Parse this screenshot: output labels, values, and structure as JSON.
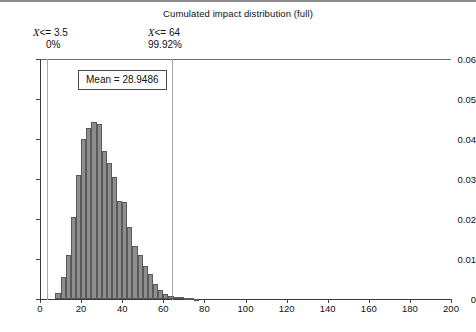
{
  "chart_data": {
    "type": "bar",
    "title": "Cumulated impact distribution (full)",
    "xlabel": "",
    "ylabel": "",
    "xlim": [
      0,
      200
    ],
    "ylim": [
      0,
      0.06
    ],
    "grid": false,
    "legend": null,
    "bin_width": 2.5,
    "x_ticks": [
      0,
      20,
      40,
      60,
      80,
      100,
      120,
      140,
      160,
      180,
      200
    ],
    "x_tick_labels": [
      "0",
      "20",
      "40",
      "60",
      "80",
      "100",
      "120",
      "140",
      "160",
      "180",
      "200"
    ],
    "y_ticks": [
      0,
      0.01,
      0.02,
      0.03,
      0.04,
      0.05,
      0.06
    ],
    "y_tick_labels": [
      "0",
      "0.01",
      "0.02",
      "0.03",
      "0.04",
      "0.05",
      "0.06"
    ],
    "bin_starts": [
      7.5,
      10.0,
      12.5,
      15.0,
      17.5,
      20.0,
      22.5,
      25.0,
      27.5,
      30.0,
      32.5,
      35.0,
      37.5,
      40.0,
      42.5,
      45.0,
      47.5,
      50.0,
      52.5,
      55.0,
      57.5,
      60.0,
      62.5,
      65.0,
      67.5,
      70.0,
      72.5,
      75.0
    ],
    "values": [
      0.0015,
      0.0055,
      0.011,
      0.0205,
      0.031,
      0.04,
      0.0428,
      0.0443,
      0.0438,
      0.037,
      0.034,
      0.0305,
      0.0245,
      0.0243,
      0.018,
      0.0133,
      0.011,
      0.0083,
      0.0063,
      0.0038,
      0.0023,
      0.0013,
      0.0008,
      0.0005,
      0.0004,
      0.0003,
      0.0002,
      0.0001
    ],
    "markers": [
      {
        "id": "lower",
        "x": 3.5,
        "label_line1": "X <= 3.5",
        "label_line2": "0%"
      },
      {
        "id": "upper",
        "x": 64,
        "label_line1": "X <= 64",
        "label_line2": "99.92%"
      }
    ],
    "mean": 28.9486,
    "mean_label": "Mean = 28.9486",
    "colors": {
      "bar_fill": "#8e8e8e",
      "bar_edge": "#5a5a5a",
      "axis": "#3a3a3a",
      "marker_line": "#a8a8a8",
      "text": "#111111",
      "background": "#ffffff"
    }
  },
  "annotations": {
    "left": {
      "variable": "X",
      "comparison": "<= 3.5",
      "percent": "0%"
    },
    "right": {
      "variable": "X",
      "comparison": "<= 64",
      "percent": "99.92%"
    },
    "mean_box": "Mean = 28.9486"
  },
  "title": "Cumulated impact distribution (full)"
}
